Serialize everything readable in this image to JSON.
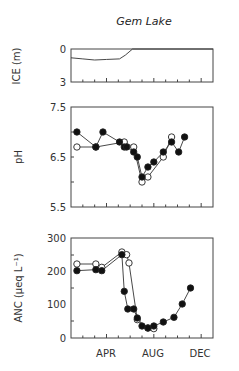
{
  "figure": {
    "title": "Gem Lake",
    "x_tick_labels": [
      "APR",
      "AUG",
      "DEC"
    ]
  },
  "chart_data": [
    {
      "type": "line",
      "title": "Gem Lake",
      "ylabel": "ICE (m)",
      "xlabel": "",
      "ylim": [
        3,
        0
      ],
      "yticks": [
        "0",
        "3"
      ],
      "x_unit": "month (1 = Jan 1)",
      "xlim": [
        0,
        12
      ],
      "series": [
        {
          "name": "ice thickness",
          "x": [
            0.0,
            1.0,
            2.0,
            3.0,
            4.1,
            4.6,
            5.2,
            12.0
          ],
          "y": [
            0.8,
            0.9,
            1.0,
            0.95,
            0.9,
            0.55,
            0.0,
            0.0
          ]
        }
      ]
    },
    {
      "type": "line",
      "ylabel": "pH",
      "xlabel": "",
      "ylim": [
        5.5,
        7.5
      ],
      "yticks": [
        "7.5",
        "6.5",
        "5.5"
      ],
      "xlim": [
        0,
        12
      ],
      "series": [
        {
          "name": "filled",
          "marker": "filled-circle",
          "x": [
            0.5,
            2.1,
            2.7,
            4.1,
            4.5,
            4.7,
            5.3,
            5.6,
            6.0,
            6.5,
            7.0,
            7.8,
            8.5,
            9.1,
            9.6
          ],
          "y": [
            7.0,
            6.7,
            7.0,
            6.8,
            6.7,
            6.7,
            6.6,
            6.5,
            6.1,
            6.3,
            6.4,
            6.6,
            6.8,
            6.6,
            6.9
          ]
        },
        {
          "name": "open",
          "marker": "open-circle",
          "x": [
            0.5,
            2.1,
            4.5,
            5.3,
            6.0,
            6.5,
            7.8,
            8.5
          ],
          "y": [
            6.7,
            6.7,
            6.8,
            6.7,
            6.0,
            6.1,
            6.5,
            6.9
          ]
        }
      ]
    },
    {
      "type": "line",
      "ylabel": "ANC (μeq L⁻¹)",
      "xlabel": "",
      "ylim": [
        0,
        300
      ],
      "yticks": [
        "300",
        "200",
        "100",
        "0"
      ],
      "x_tick_labels": [
        "APR",
        "AUG",
        "DEC"
      ],
      "xlim": [
        0,
        12
      ],
      "series": [
        {
          "name": "filled",
          "marker": "filled-circle",
          "x": [
            0.5,
            2.1,
            2.6,
            4.3,
            4.5,
            4.8,
            5.3,
            5.6,
            6.0,
            6.5,
            7.0,
            7.8,
            8.7,
            9.4,
            10.1
          ],
          "y": [
            202,
            205,
            202,
            250,
            140,
            87,
            87,
            60,
            36,
            30,
            36,
            48,
            62,
            102,
            150
          ]
        },
        {
          "name": "open",
          "marker": "open-circle",
          "x": [
            0.5,
            2.1,
            2.6,
            4.3,
            4.7,
            4.9,
            5.6,
            6.5,
            7.0
          ],
          "y": [
            222,
            222,
            212,
            258,
            250,
            225,
            55,
            30,
            28
          ]
        }
      ]
    }
  ]
}
